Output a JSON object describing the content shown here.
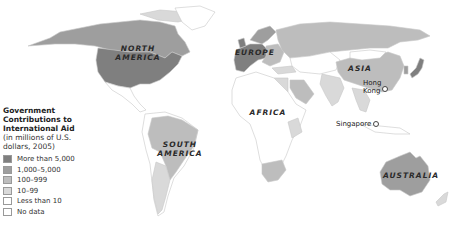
{
  "legend": {
    "title_lines": [
      "Government",
      "Contributions to",
      "International Aid"
    ],
    "subtitle_lines": [
      "(in millions of U.S.",
      "dollars, 2005)"
    ],
    "items": [
      {
        "label": "More than 5,000",
        "color": "#7f7f7f"
      },
      {
        "label": "1,000–5,000",
        "color": "#9e9e9e"
      },
      {
        "label": "100–999",
        "color": "#bdbdbd"
      },
      {
        "label": "10–99",
        "color": "#d9d9d9"
      },
      {
        "label": "Less than 10",
        "color": "#ffffff"
      },
      {
        "label": "No data",
        "color": "#ffffff"
      }
    ]
  },
  "regions": {
    "north_america": [
      "NORTH",
      "AMERICA"
    ],
    "europe": "EUROPE",
    "asia": "ASIA",
    "africa": "AFRICA",
    "south_america": [
      "SOUTH",
      "AMERICA"
    ],
    "australia": "AUSTRALIA"
  },
  "cities": {
    "hong_kong": [
      "Hong",
      "Kong"
    ],
    "singapore": "Singapore"
  },
  "colors": {
    "more_than_5000": "#7f7f7f",
    "c1000_5000": "#9e9e9e",
    "c100_999": "#bdbdbd",
    "c10_99": "#d9d9d9",
    "less_than_10": "#ffffff",
    "border": "#c8c8c8"
  }
}
